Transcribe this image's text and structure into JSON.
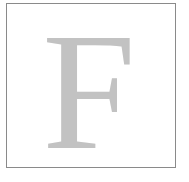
{
  "card": {
    "glyph": "F",
    "glyph_color": "#c2c2c2",
    "border_color": "#8a8a8a"
  }
}
